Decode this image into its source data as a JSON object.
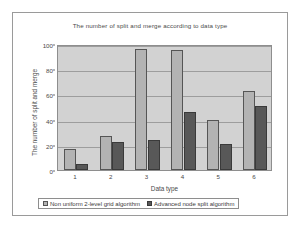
{
  "chart_data": {
    "type": "bar",
    "title": "The number of split and merge according to data type",
    "xlabel": "Data type",
    "ylabel": "The number of split and merge",
    "categories": [
      "1",
      "2",
      "3",
      "4",
      "5",
      "6"
    ],
    "series": [
      {
        "name": "Non uniform 2-level grid algorithm",
        "color": "#b3b3b3",
        "values": [
          17,
          27,
          96,
          95,
          40,
          63
        ]
      },
      {
        "name": "Advanced node split algorithm",
        "color": "#585858",
        "values": [
          5,
          22,
          24,
          46,
          21,
          51
        ]
      }
    ],
    "ylim": [
      0,
      100
    ],
    "yticks": [
      0,
      20,
      40,
      60,
      80,
      100
    ],
    "grid": true,
    "legend_position": "bottom",
    "plot_background": "#d2d2d2"
  }
}
